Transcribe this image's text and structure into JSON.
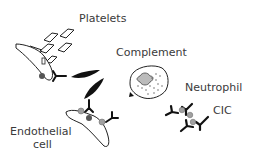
{
  "diagram": {
    "labels": {
      "platelets": "Platelets",
      "complement": "Complement",
      "neutrophil": "Neutrophil",
      "cic": "CIC",
      "endothelial_line1": "Endothelial",
      "endothelial_line2": "cell"
    },
    "elements": [
      {
        "name": "platelets",
        "shape": "outlined parallelograms",
        "count": 5
      },
      {
        "name": "endothelial-cell-upper",
        "shape": "elongated outlined cell with nucleus"
      },
      {
        "name": "endothelial-cell-lower",
        "shape": "elongated outlined cell with nucleus"
      },
      {
        "name": "complement-fragments",
        "shape": "black spindle shapes",
        "count": 2
      },
      {
        "name": "neutrophil",
        "shape": "round cell with lobed nucleus and granules"
      },
      {
        "name": "antibodies",
        "shape": "Y-shaped black glyphs"
      },
      {
        "name": "circulating-immune-complexes",
        "shape": "antibodies with grey antigen dots"
      }
    ],
    "colors": {
      "outline": "#1a1a1a",
      "fill_dark": "#111111",
      "antigen_grey": "#a0a0a0",
      "nucleus_grey": "#555555",
      "text": "#3a3a3a",
      "background": "#ffffff"
    }
  }
}
